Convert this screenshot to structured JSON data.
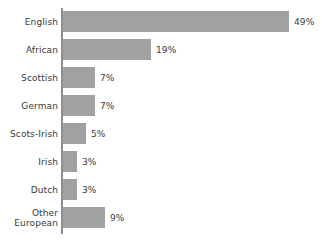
{
  "chart_data": {
    "type": "bar",
    "orientation": "horizontal",
    "title": "",
    "subtitle": "",
    "xlabel": "",
    "ylabel": "",
    "xlim": [
      0,
      49
    ],
    "grid": false,
    "legend": null,
    "value_suffix": "%",
    "categories": [
      "English",
      "African",
      "Scottish",
      "German",
      "Scots-Irish",
      "Irish",
      "Dutch",
      "Other\nEuropean"
    ],
    "values": [
      49,
      19,
      7,
      7,
      5,
      3,
      3,
      9
    ],
    "data_labels": [
      "49%",
      "19%",
      "7%",
      "7%",
      "5%",
      "3%",
      "3%",
      "9%"
    ],
    "colors": {
      "bar_fill": "#a1a1a1",
      "axis_line": "#8f8f8f",
      "text": "#3a3a3a",
      "background": "#ffffff"
    }
  },
  "scale": {
    "px_per_percent": 4.62,
    "axis_x": 63,
    "row_height": 28,
    "bar_height": 21,
    "top_offset": 8
  }
}
